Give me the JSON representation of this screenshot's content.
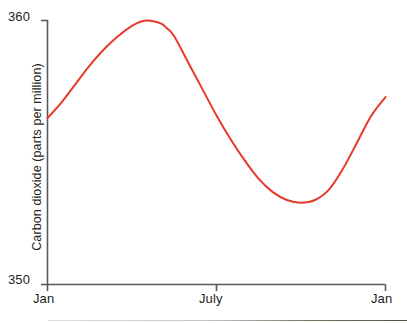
{
  "chart_data": {
    "type": "line",
    "title": "",
    "subtitle": "",
    "xlabel": "",
    "ylabel": "Carbon dioxide (parts per million)",
    "ylim": [
      350,
      360
    ],
    "xlim": [
      0,
      12
    ],
    "grid": false,
    "legend": null,
    "y_ticks": [
      "360",
      "350"
    ],
    "y_tick_values": [
      360,
      350
    ],
    "x_ticks": [
      "Jan",
      "July",
      "Jan"
    ],
    "x_tick_values": [
      0,
      6,
      12
    ],
    "line_color": "#e8392a",
    "axis_color": "#58595b",
    "series": [
      {
        "name": "Carbon dioxide",
        "x": [
          0,
          0.5,
          1,
          1.5,
          2,
          2.5,
          3,
          3.5,
          4,
          4.25,
          4.5,
          5,
          5.5,
          6,
          6.5,
          7,
          7.5,
          8,
          8.5,
          9,
          9.5,
          10,
          10.5,
          11,
          11.5,
          12
        ],
        "values": [
          356.3,
          356.9,
          357.6,
          358.3,
          358.9,
          359.4,
          359.8,
          360.0,
          359.9,
          359.7,
          359.4,
          358.4,
          357.4,
          356.4,
          355.5,
          354.7,
          354.0,
          353.5,
          353.2,
          353.1,
          353.2,
          353.6,
          354.4,
          355.4,
          356.4,
          357.1
        ]
      }
    ],
    "annotations": []
  },
  "axis_labels": {
    "y_top": "360",
    "y_bottom": "350",
    "x_start": "Jan",
    "x_middle": "July",
    "x_end": "Jan",
    "y_title": "Carbon dioxide (parts per million)"
  }
}
